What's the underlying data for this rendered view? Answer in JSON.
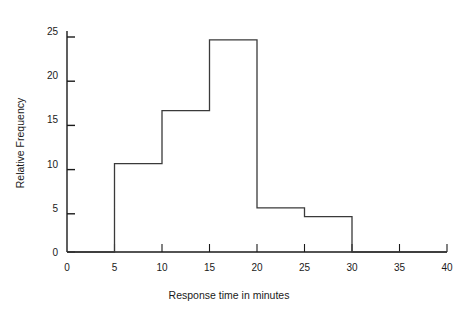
{
  "chart_data": {
    "type": "bar",
    "title": "",
    "subtitle": "",
    "xlabel": "Response time in minutes",
    "ylabel": "Relative Frequency",
    "xlim": [
      0,
      40
    ],
    "ylim": [
      0,
      25
    ],
    "grid": false,
    "legend": null,
    "style": "histogram-outline",
    "bin_width": 5,
    "bin_edges": [
      0,
      5,
      10,
      15,
      20,
      25,
      30,
      35,
      40
    ],
    "categories": [
      "0-5",
      "5-10",
      "10-15",
      "15-20",
      "20-25",
      "25-30",
      "30-35",
      "35-40"
    ],
    "values": [
      0,
      10,
      16,
      24,
      5,
      4,
      0,
      0
    ],
    "xticks": [
      0,
      5,
      10,
      15,
      20,
      25,
      30,
      35,
      40
    ],
    "xtick_labels": [
      "0",
      "5",
      "10",
      "15",
      "20",
      "25",
      "30",
      "35",
      "40"
    ],
    "yticks": [
      0,
      5,
      10,
      15,
      20,
      25
    ],
    "ytick_labels": [
      "0",
      "5",
      "10",
      "15",
      "20",
      "25"
    ],
    "line_color": "#3a3a3a",
    "fill_color": "none",
    "background_color": "#ffffff",
    "axis_color": "#1a1a1a"
  }
}
